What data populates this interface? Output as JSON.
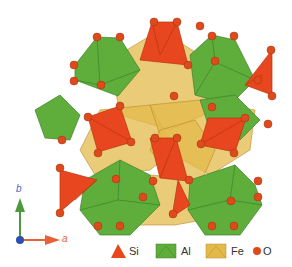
{
  "figure": {
    "colors": {
      "si": "#e8461e",
      "al": "#5fae3c",
      "fe": "#e3b94a",
      "o": "#dd4a1c",
      "axis_a": "#e8603a",
      "axis_b": "#4c9a3c",
      "axis_origin": "#2e4fb0"
    }
  },
  "axes": {
    "a_label": "a",
    "b_label": "b"
  },
  "legend": {
    "items": [
      {
        "symbol": "triangle",
        "label": "Si"
      },
      {
        "symbol": "square",
        "label": "Al"
      },
      {
        "symbol": "square",
        "label": "Fe"
      },
      {
        "symbol": "circle",
        "label": "O"
      }
    ]
  }
}
